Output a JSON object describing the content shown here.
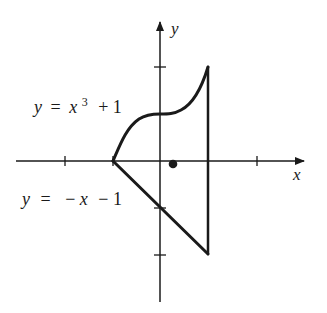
{
  "diagram": {
    "type": "region-in-plane",
    "axes": {
      "x_label": "x",
      "y_label": "y",
      "x_ticks": [
        -2,
        -1,
        1,
        2
      ],
      "y_ticks": [
        2,
        1,
        -1,
        -2
      ],
      "origin_px": [
        160,
        161
      ],
      "unit_px": 47.5
    },
    "curves": [
      {
        "name": "upper-curve",
        "equation_label": "y = x³ + 1",
        "label_parts": {
          "lhs": "y",
          "eq": "=",
          "var": "x",
          "exp": "3",
          "rest": "+ 1"
        },
        "x_range": [
          -1,
          1
        ]
      },
      {
        "name": "lower-line",
        "equation_label": "y = −x − 1",
        "label_parts": {
          "lhs": "y",
          "eq": "=",
          "neg": "−",
          "var": "x",
          "rest": "− 1"
        },
        "x_range": [
          -1,
          1
        ]
      },
      {
        "name": "right-boundary",
        "equation_label": "x = 1",
        "y_range": [
          -2,
          2
        ]
      }
    ],
    "centroid_point": {
      "x": 0.27,
      "y": -0.05
    },
    "colors": {
      "ink": "#1a1a1a",
      "background": "#ffffff"
    }
  }
}
